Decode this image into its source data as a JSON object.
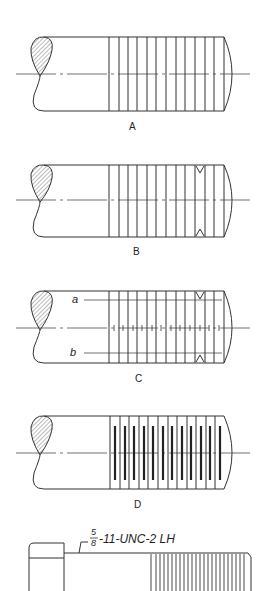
{
  "figure": {
    "views": [
      {
        "id": "A",
        "label": "A",
        "style": "simplified-lines"
      },
      {
        "id": "B",
        "label": "B",
        "style": "simplified-lines-with-root-marks"
      },
      {
        "id": "C",
        "label": "C",
        "style": "simplified-with-root-lines",
        "root_labels": [
          "a",
          "b"
        ]
      },
      {
        "id": "D",
        "label": "D",
        "style": "simplified-with-dark-bars"
      }
    ],
    "callout": {
      "fraction_numerator": "5",
      "fraction_denominator": "8",
      "spec": "-11-UNC-2 LH"
    }
  },
  "colors": {
    "line": "#333333",
    "hatch": "#555555",
    "background": "#ffffff"
  }
}
